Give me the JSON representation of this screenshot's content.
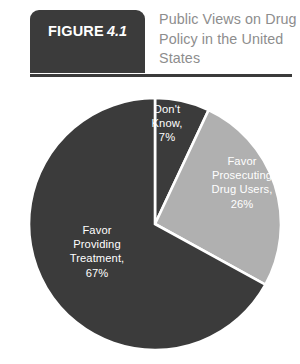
{
  "header": {
    "badge_word": "FIGURE",
    "badge_number": "4.1",
    "title": "Public Views on Drug Policy in the United States",
    "badge_color": "#3b3b3b",
    "title_color": "#8d8d8d",
    "rule_color": "#3b3b3b"
  },
  "chart_data": {
    "type": "pie",
    "title": "Public Views on Drug Policy in the United States",
    "xlabel": "",
    "ylabel": "",
    "grid": false,
    "legend_position": "none",
    "label_style": "inside-slice",
    "start_angle_deg": 0,
    "direction": "clockwise",
    "categories": [
      "Don't Know",
      "Favor Prosecuting Drug Users",
      "Favor Providing Treatment"
    ],
    "values": [
      7,
      26,
      67
    ],
    "unit": "%",
    "slices": [
      {
        "label": "Don't\nKnow,\n7%",
        "name": "Don't Know",
        "value": 7,
        "color": "#3b3b3b",
        "label_color": "#ffffff"
      },
      {
        "label": "Favor\nProsecuting\nDrug Users,\n26%",
        "name": "Favor Prosecuting Drug Users",
        "value": 26,
        "color": "#b0b0b0",
        "label_color": "#ffffff"
      },
      {
        "label": "Favor\nProviding\nTreatment,\n67%",
        "name": "Favor Providing Treatment",
        "value": 67,
        "color": "#3b3b3b",
        "label_color": "#ffffff"
      }
    ],
    "separator_color": "#ffffff"
  }
}
